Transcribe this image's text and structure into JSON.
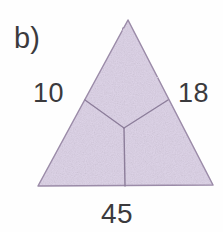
{
  "figure": {
    "part_label": "b)",
    "shape": "triangle",
    "background_color": "#fefefe",
    "fill_color": "#ded4e8",
    "stroke_color": "#9b8ba8",
    "text_color": "#3b3a3d",
    "side_labels": {
      "left": "10",
      "right": "18",
      "bottom": "45"
    },
    "geometry": {
      "apex": [
        128,
        20
      ],
      "bottom_left": [
        38,
        186
      ],
      "bottom_right": [
        213,
        185
      ],
      "junction_center": [
        124,
        128
      ],
      "junction_left_edge": [
        85,
        100
      ],
      "junction_right_edge": [
        168,
        100
      ],
      "junction_base": [
        125,
        186
      ]
    },
    "regions": [
      "top-region",
      "lower-left-region",
      "lower-right-region"
    ]
  }
}
